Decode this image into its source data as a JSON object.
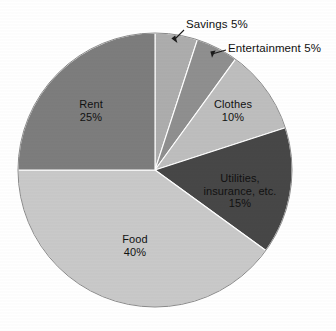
{
  "chart_data": {
    "type": "pie",
    "title": "",
    "subtitle": "",
    "legend_position": "none",
    "grid": false,
    "start_angle_deg": 0,
    "direction": "clockwise",
    "categories": [
      "Savings",
      "Entertainment",
      "Clothes",
      "Utilities, insurance, etc.",
      "Food",
      "Rent"
    ],
    "values": [
      5,
      5,
      10,
      15,
      40,
      25
    ],
    "value_unit": "%",
    "slices": [
      {
        "name": "Savings",
        "label": "Savings 5%",
        "value": 5,
        "value_text": "5%",
        "color": "#adadad",
        "label_style": "callout",
        "label_lines": [
          "Savings 5%"
        ]
      },
      {
        "name": "Entertainment",
        "label": "Entertainment 5%",
        "value": 5,
        "value_text": "5%",
        "color": "#8f8f8f",
        "label_style": "callout",
        "label_lines": [
          "Entertainment 5%"
        ]
      },
      {
        "name": "Clothes",
        "label": "Clothes 10%",
        "value": 10,
        "value_text": "10%",
        "color": "#bebebe",
        "label_style": "inside",
        "label_lines": [
          "Clothes",
          "10%"
        ]
      },
      {
        "name": "Utilities, insurance, etc.",
        "label": "Utilities, insurance, etc. 15%",
        "value": 15,
        "value_text": "15%",
        "color": "#474747",
        "label_style": "inside",
        "label_lines": [
          "Utilities,",
          "insurance, etc.",
          "15%"
        ]
      },
      {
        "name": "Food",
        "label": "Food 40%",
        "value": 40,
        "value_text": "40%",
        "color": "#c9c9c9",
        "label_style": "inside",
        "label_lines": [
          "Food",
          "40%"
        ]
      },
      {
        "name": "Rent",
        "label": "Rent 25%",
        "value": 25,
        "value_text": "25%",
        "color": "#7d7d7d",
        "label_style": "inside",
        "label_lines": [
          "Rent",
          "25%"
        ]
      }
    ]
  },
  "labels": {
    "rent": "Rent\n25%",
    "food": "Food\n40%",
    "clothes": "Clothes\n10%",
    "utilities": "Utilities,\ninsurance, etc.\n15%",
    "savings": "Savings 5%",
    "entertainment": "Entertainment 5%"
  }
}
